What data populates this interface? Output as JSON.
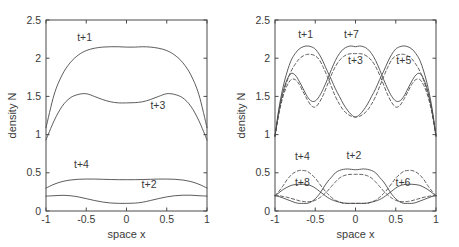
{
  "figure": {
    "background_color": "#ffffff",
    "line_color": "#4a4a4a",
    "panel_count": 2
  },
  "chart_data": [
    {
      "type": "line",
      "panel": "left",
      "title": "",
      "xlabel": "space x",
      "ylabel": "density N",
      "xlim": [
        -1,
        1
      ],
      "ylim": [
        0,
        2.5
      ],
      "xticks": [
        -1,
        -0.5,
        0,
        0.5,
        1
      ],
      "xticklabels": [
        "-1",
        "-0.5",
        "0",
        "0.5",
        "1"
      ],
      "yticks": [
        0,
        0.5,
        1,
        1.5,
        2,
        2.5
      ],
      "yticklabels": [
        "0",
        "0.5",
        "1",
        "1.5",
        "2",
        "2.5"
      ],
      "grid": false,
      "legend": "inline-annotations",
      "x": [
        -1,
        -0.9,
        -0.8,
        -0.7,
        -0.6,
        -0.5,
        -0.4,
        -0.3,
        -0.2,
        -0.1,
        0,
        0.1,
        0.2,
        0.3,
        0.4,
        0.5,
        0.6,
        0.7,
        0.8,
        0.9,
        1
      ],
      "series": [
        {
          "name": "t+1",
          "style": "solid",
          "label": "t+1",
          "label_x": -0.52,
          "label_y": 2.22,
          "values": [
            1.09,
            1.52,
            1.78,
            1.94,
            2.04,
            2.1,
            2.13,
            2.145,
            2.15,
            2.15,
            2.145,
            2.145,
            2.15,
            2.145,
            2.13,
            2.1,
            2.04,
            1.94,
            1.78,
            1.52,
            1.09
          ]
        },
        {
          "name": "t+3",
          "style": "solid",
          "label": "t+3",
          "label_x": 0.39,
          "label_y": 1.33,
          "values": [
            0.93,
            1.18,
            1.37,
            1.48,
            1.525,
            1.535,
            1.5,
            1.46,
            1.43,
            1.415,
            1.415,
            1.418,
            1.43,
            1.46,
            1.5,
            1.535,
            1.525,
            1.48,
            1.37,
            1.18,
            0.93
          ]
        },
        {
          "name": "t+4",
          "style": "solid",
          "label": "t+4",
          "label_x": -0.56,
          "label_y": 0.565,
          "values": [
            0.3,
            0.35,
            0.385,
            0.405,
            0.415,
            0.418,
            0.418,
            0.415,
            0.412,
            0.41,
            0.41,
            0.41,
            0.412,
            0.415,
            0.418,
            0.418,
            0.415,
            0.405,
            0.385,
            0.35,
            0.3
          ]
        },
        {
          "name": "t+2",
          "style": "solid",
          "label": "t+2",
          "label_x": 0.28,
          "label_y": 0.3,
          "values": [
            0.195,
            0.2,
            0.205,
            0.2,
            0.185,
            0.162,
            0.138,
            0.118,
            0.105,
            0.1,
            0.1,
            0.103,
            0.115,
            0.138,
            0.163,
            0.185,
            0.2,
            0.207,
            0.207,
            0.2,
            0.195
          ]
        }
      ]
    },
    {
      "type": "line",
      "panel": "right",
      "title": "",
      "xlabel": "space x",
      "ylabel": "density N",
      "xlim": [
        -1,
        1
      ],
      "ylim": [
        0,
        2.5
      ],
      "xticks": [
        -1,
        -0.5,
        0,
        0.5,
        1
      ],
      "xticklabels": [
        "-1",
        "-0.5",
        "0",
        "0.5",
        "1"
      ],
      "yticks": [
        0,
        0.5,
        1,
        1.5,
        2,
        2.5
      ],
      "yticklabels": [
        "0",
        "0.5",
        "1",
        "1.5",
        "2",
        "2.5"
      ],
      "grid": false,
      "legend": "inline-annotations",
      "x": [
        -1,
        -0.95,
        -0.9,
        -0.85,
        -0.8,
        -0.75,
        -0.7,
        -0.65,
        -0.6,
        -0.55,
        -0.5,
        -0.45,
        -0.4,
        -0.35,
        -0.3,
        -0.25,
        -0.2,
        -0.15,
        -0.1,
        -0.05,
        0,
        0.05,
        0.1,
        0.15,
        0.2,
        0.25,
        0.3,
        0.35,
        0.4,
        0.45,
        0.5,
        0.55,
        0.6,
        0.65,
        0.7,
        0.75,
        0.8,
        0.85,
        0.9,
        0.95,
        1
      ],
      "series": [
        {
          "name": "t+1",
          "style": "solid",
          "label": "t+1",
          "label_x": -0.62,
          "label_y": 2.26,
          "values": [
            0.98,
            1.35,
            1.62,
            1.82,
            1.97,
            2.06,
            2.12,
            2.15,
            2.16,
            2.15,
            2.12,
            2.05,
            1.95,
            1.83,
            1.72,
            1.6,
            1.5,
            1.4,
            1.32,
            1.26,
            1.23,
            1.26,
            1.32,
            1.4,
            1.5,
            1.6,
            1.72,
            1.83,
            1.95,
            2.05,
            2.12,
            2.15,
            2.16,
            2.15,
            2.12,
            2.06,
            1.97,
            1.82,
            1.62,
            1.35,
            0.98
          ]
        },
        {
          "name": "t+7",
          "style": "solid",
          "label": "t+7",
          "label_x": -0.05,
          "label_y": 2.26,
          "values": [
            0.98,
            1.32,
            1.56,
            1.72,
            1.8,
            1.78,
            1.7,
            1.6,
            1.5,
            1.44,
            1.44,
            1.5,
            1.6,
            1.72,
            1.85,
            1.97,
            2.06,
            2.12,
            2.15,
            2.16,
            2.15,
            2.16,
            2.15,
            2.12,
            2.06,
            1.97,
            1.85,
            1.72,
            1.6,
            1.5,
            1.44,
            1.44,
            1.5,
            1.6,
            1.7,
            1.78,
            1.8,
            1.72,
            1.56,
            1.32,
            0.98
          ]
        },
        {
          "name": "t+3",
          "style": "dashed",
          "label": "t+3",
          "label_x": 0.0,
          "label_y": 1.92,
          "values": [
            0.98,
            1.3,
            1.53,
            1.7,
            1.83,
            1.92,
            1.99,
            2.03,
            2.05,
            2.05,
            2.03,
            1.98,
            1.88,
            1.76,
            1.63,
            1.5,
            1.4,
            1.32,
            1.27,
            1.24,
            1.23,
            1.24,
            1.27,
            1.32,
            1.4,
            1.5,
            1.63,
            1.76,
            1.88,
            1.98,
            2.03,
            2.05,
            2.05,
            2.03,
            1.99,
            1.92,
            1.83,
            1.7,
            1.53,
            1.3,
            0.98
          ]
        },
        {
          "name": "t+5",
          "style": "dashed",
          "label": "t+5",
          "label_x": 0.6,
          "label_y": 1.92,
          "values": [
            0.98,
            1.28,
            1.5,
            1.64,
            1.72,
            1.72,
            1.66,
            1.56,
            1.46,
            1.38,
            1.36,
            1.42,
            1.52,
            1.65,
            1.78,
            1.89,
            1.97,
            2.02,
            2.05,
            2.06,
            2.06,
            2.06,
            2.05,
            2.02,
            1.97,
            1.89,
            1.78,
            1.65,
            1.52,
            1.42,
            1.36,
            1.38,
            1.46,
            1.56,
            1.66,
            1.72,
            1.72,
            1.64,
            1.5,
            1.28,
            0.98
          ]
        },
        {
          "name": "t+4",
          "style": "dashed",
          "label": "t+4",
          "label_x": -0.66,
          "label_y": 0.67,
          "values": [
            0.2,
            0.26,
            0.33,
            0.41,
            0.47,
            0.51,
            0.53,
            0.53,
            0.52,
            0.48,
            0.43,
            0.36,
            0.29,
            0.23,
            0.18,
            0.14,
            0.12,
            0.1,
            0.1,
            0.1,
            0.1,
            0.1,
            0.1,
            0.1,
            0.12,
            0.14,
            0.18,
            0.23,
            0.29,
            0.36,
            0.43,
            0.48,
            0.52,
            0.53,
            0.53,
            0.51,
            0.47,
            0.41,
            0.33,
            0.26,
            0.2
          ]
        },
        {
          "name": "t+2",
          "style": "solid",
          "label": "t+2",
          "label_x": -0.02,
          "label_y": 0.68,
          "values": [
            0.2,
            0.19,
            0.17,
            0.15,
            0.13,
            0.11,
            0.1,
            0.1,
            0.1,
            0.12,
            0.16,
            0.22,
            0.3,
            0.38,
            0.44,
            0.5,
            0.53,
            0.545,
            0.55,
            0.545,
            0.54,
            0.545,
            0.55,
            0.545,
            0.53,
            0.5,
            0.44,
            0.38,
            0.3,
            0.22,
            0.16,
            0.12,
            0.1,
            0.1,
            0.1,
            0.11,
            0.13,
            0.15,
            0.17,
            0.19,
            0.2
          ]
        },
        {
          "name": "t+8",
          "style": "solid",
          "label": "t+8",
          "label_x": -0.66,
          "label_y": 0.33,
          "values": [
            0.2,
            0.24,
            0.28,
            0.31,
            0.335,
            0.345,
            0.35,
            0.35,
            0.345,
            0.33,
            0.3,
            0.26,
            0.22,
            0.18,
            0.15,
            0.13,
            0.115,
            0.105,
            0.1,
            0.1,
            0.1,
            0.1,
            0.1,
            0.105,
            0.115,
            0.13,
            0.15,
            0.18,
            0.22,
            0.26,
            0.3,
            0.33,
            0.345,
            0.35,
            0.35,
            0.345,
            0.335,
            0.31,
            0.28,
            0.24,
            0.2
          ]
        },
        {
          "name": "t+6",
          "style": "dashed",
          "label": "t+6",
          "label_x": 0.59,
          "label_y": 0.33,
          "values": [
            0.2,
            0.2,
            0.19,
            0.18,
            0.165,
            0.15,
            0.135,
            0.125,
            0.12,
            0.125,
            0.14,
            0.17,
            0.21,
            0.26,
            0.32,
            0.38,
            0.43,
            0.46,
            0.475,
            0.48,
            0.48,
            0.48,
            0.475,
            0.46,
            0.43,
            0.38,
            0.32,
            0.26,
            0.21,
            0.17,
            0.14,
            0.125,
            0.12,
            0.125,
            0.135,
            0.15,
            0.165,
            0.18,
            0.19,
            0.2,
            0.2
          ]
        }
      ]
    }
  ]
}
